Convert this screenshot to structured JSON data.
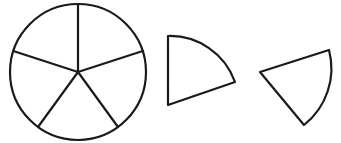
{
  "diagram": {
    "circle": {
      "divisions": 5,
      "sector_angle_degrees": 72
    },
    "pieces": [
      {
        "name": "sector-piece-1",
        "angle_degrees": 72,
        "fraction": "1/5"
      },
      {
        "name": "sector-piece-2",
        "angle_degrees": 72,
        "fraction": "1/5"
      }
    ],
    "colors": {
      "stroke": "#1a1a1a",
      "fill": "#ffffff"
    }
  }
}
